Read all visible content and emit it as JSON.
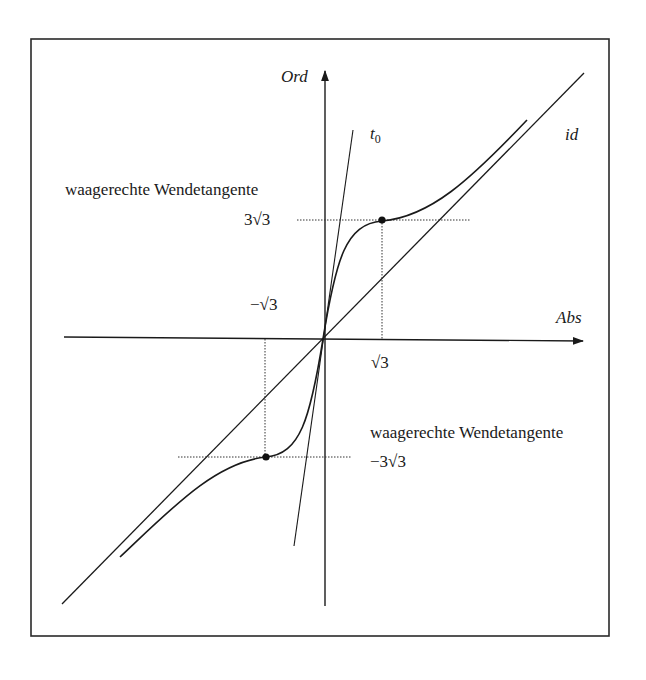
{
  "figure": {
    "frame": {
      "x1": 31,
      "y1": 39,
      "x2": 609,
      "y2": 636
    },
    "axes": {
      "origin": [
        323,
        339
      ],
      "x_axis": {
        "from": [
          64,
          337
        ],
        "to": [
          583,
          341
        ],
        "label": "Abs"
      },
      "y_axis": {
        "from": [
          325,
          606
        ],
        "to": [
          325,
          71
        ],
        "label": "Ord"
      }
    },
    "lines": {
      "id": {
        "label": "id",
        "from": [
          62,
          604
        ],
        "to": [
          584,
          73
        ]
      },
      "t0": {
        "label_base": "t",
        "label_sub": "0",
        "from": [
          294,
          546
        ],
        "to": [
          353,
          130
        ]
      }
    },
    "curve": {
      "description": "Graph with horizontal inflection tangents at x = ±√3",
      "path": "M 120 557 C 170 510, 215 462, 266 457 C 300 454, 310 420, 323 339 C 336 258, 346 224, 382 221 C 430 217, 470 180, 527 120"
    },
    "inflection_points": [
      {
        "x_label": "√3",
        "y_label": "3√3",
        "point": [
          382,
          220
        ]
      },
      {
        "x_label": "−√3",
        "y_label": "−3√3",
        "point": [
          266,
          457
        ]
      }
    ],
    "guides": {
      "upper_horizontal": {
        "from": [
          297,
          220
        ],
        "to": [
          470,
          220
        ]
      },
      "upper_vertical": {
        "from": [
          382,
          220
        ],
        "to": [
          382,
          339
        ]
      },
      "lower_horizontal": {
        "from": [
          178,
          457
        ],
        "to": [
          352,
          457
        ]
      },
      "lower_vertical": {
        "from": [
          265,
          339
        ],
        "to": [
          265,
          457
        ]
      }
    },
    "labels": {
      "upper_annotation": "waagerechte Wendetangente",
      "lower_annotation": "waagerechte Wendetangente",
      "y_pos_value": "3√3",
      "y_neg_value": "−3√3",
      "x_pos_value": "√3",
      "x_neg_value": "−√3",
      "abs": "Abs",
      "ord": "Ord",
      "id": "id",
      "t0_base": "t",
      "t0_sub": "0"
    },
    "colors": {
      "ink": "#1a1a1a",
      "background": "#ffffff"
    }
  }
}
